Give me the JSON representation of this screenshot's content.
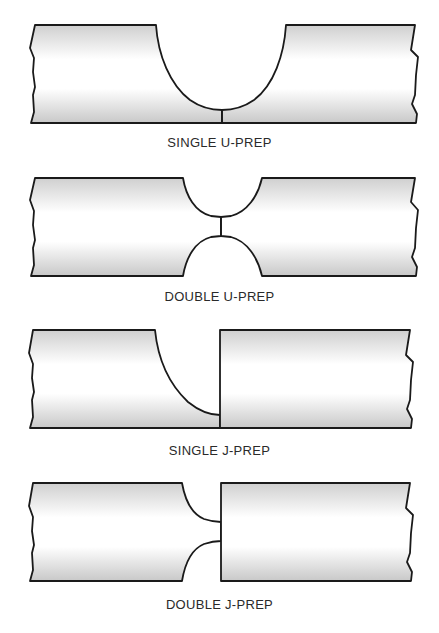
{
  "diagram": {
    "type": "weld-joint-preparations",
    "colors": {
      "outline": "#1a1a1a",
      "shade": "#cfcfcf",
      "background": "#ffffff",
      "label": "#2a2a2a"
    },
    "figures": [
      {
        "id": "single-u-prep",
        "label": "SINGLE U-PREP"
      },
      {
        "id": "double-u-prep",
        "label": "DOUBLE U-PREP"
      },
      {
        "id": "single-j-prep",
        "label": "SINGLE J-PREP"
      },
      {
        "id": "double-j-prep",
        "label": "DOUBLE J-PREP"
      }
    ]
  }
}
